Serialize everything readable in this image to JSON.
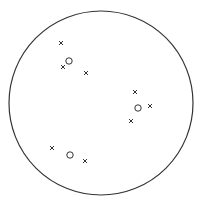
{
  "diagram": {
    "type": "cluster-plot",
    "background": "#ffffff",
    "stroke": "#333333",
    "boundary": {
      "cx": 101,
      "cy": 103,
      "r": 92
    },
    "clusters": [
      {
        "name": "top-left",
        "centroid": {
          "x": 69,
          "y": 61
        },
        "points": [
          {
            "x": 61,
            "y": 43
          },
          {
            "x": 63,
            "y": 67
          },
          {
            "x": 86,
            "y": 73
          }
        ]
      },
      {
        "name": "right",
        "centroid": {
          "x": 138,
          "y": 108
        },
        "points": [
          {
            "x": 135,
            "y": 92
          },
          {
            "x": 150,
            "y": 106
          },
          {
            "x": 131,
            "y": 121
          }
        ]
      },
      {
        "name": "bottom-left",
        "centroid": {
          "x": 70,
          "y": 155
        },
        "points": [
          {
            "x": 52,
            "y": 148
          },
          {
            "x": 85,
            "y": 161
          }
        ]
      }
    ],
    "point_marker": "×",
    "centroid_marker": "○"
  }
}
